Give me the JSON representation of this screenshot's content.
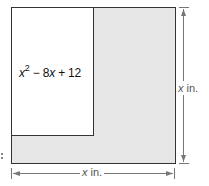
{
  "figure": {
    "type": "area-diagram",
    "outer_square": {
      "shape": "square",
      "fill": "#e6e6e6",
      "stroke": "#333333",
      "width_label": {
        "variable": "x",
        "unit": " in."
      },
      "height_label": {
        "variable": "x",
        "unit": " in."
      }
    },
    "inner_rectangle": {
      "shape": "rectangle",
      "fill": "#ffffff",
      "stroke": "#333333",
      "area_expression": {
        "term1_var": "x",
        "term1_exp": "2",
        "op1": " − 8",
        "term2_var": "x",
        "op2": " + 12"
      }
    },
    "dimension_line_color": "#777777",
    "label_color": "#555555"
  }
}
